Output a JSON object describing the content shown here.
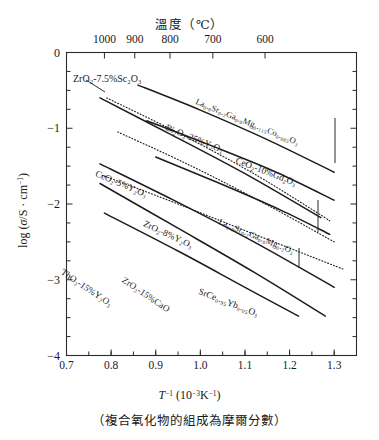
{
  "figure": {
    "top_axis_title": "溫度（℃）",
    "caption": "（複合氧化物的組成為摩爾分數）",
    "x_axis_label_html": "T⁻¹ (10⁻³K⁻¹)",
    "y_axis_label_html": "log (σ/S · cm⁻¹)"
  },
  "chart_data": {
    "type": "line",
    "title": "",
    "xlabel": "T^-1 (10^-3 K^-1)",
    "ylabel": "log (sigma / S cm^-1)",
    "xlim": [
      0.7,
      1.35
    ],
    "ylim": [
      -4,
      0
    ],
    "grid": false,
    "legend": "inline-curve-labels",
    "x_ticks": [
      "0.7",
      "0.8",
      "0.9",
      "1.0",
      "1.1",
      "1.2",
      "1.3"
    ],
    "x_tick_values": [
      0.7,
      0.8,
      0.9,
      1.0,
      1.1,
      1.2,
      1.3
    ],
    "y_ticks": [
      "0",
      "-1",
      "-2",
      "-3",
      "-4"
    ],
    "y_tick_values": [
      0,
      -1,
      -2,
      -3,
      -4
    ],
    "secondary_x_axis": {
      "label": "溫度（℃）",
      "ticks": [
        "1000",
        "900",
        "800",
        "700",
        "600"
      ],
      "tick_values_celsius": [
        1000,
        900,
        800,
        700,
        600
      ],
      "tick_x_inverse_T": [
        0.785,
        0.853,
        0.932,
        1.028,
        1.145
      ]
    },
    "series": [
      {
        "name": "ZrO2-7.5%Sc2O3",
        "label": "ZrO₂-7.5%Sc₂O₃",
        "style": "solid",
        "points": [
          [
            0.775,
            -0.6
          ],
          [
            0.93,
            -1.07
          ],
          [
            1.1,
            -1.6
          ],
          [
            1.27,
            -2.18
          ]
        ]
      },
      {
        "name": "Bi2O3-25%Y2O3",
        "label": "Bi₂O₃-25%Y₂O₃",
        "style": "dotted",
        "points": [
          [
            0.79,
            -0.6
          ],
          [
            0.95,
            -1.06
          ],
          [
            1.12,
            -1.6
          ],
          [
            1.29,
            -2.22
          ]
        ]
      },
      {
        "name": "La0.8Sr0.2Ga0.8Mg0.115Co0.085O3",
        "label": "La₀.₈Sr₀.₂Ga₀.₈Mg₀.₁₁₅Co₀.₀₈₅O₃",
        "style": "solid",
        "points": [
          [
            0.86,
            -0.43
          ],
          [
            1.0,
            -0.76
          ],
          [
            1.15,
            -1.15
          ],
          [
            1.3,
            -1.58
          ]
        ]
      },
      {
        "name": "CeO2-5%Y2O3",
        "label": "CeO₂-5%Y₂O₃",
        "style": "dotted",
        "points": [
          [
            0.815,
            -1.05
          ],
          [
            0.97,
            -1.47
          ],
          [
            1.13,
            -1.95
          ],
          [
            1.3,
            -2.5
          ]
        ]
      },
      {
        "name": "CeO2-10%Gd2O3",
        "label": "CeO₂-10%Gd₂O₃",
        "style": "solid",
        "points": [
          [
            0.88,
            -0.9
          ],
          [
            1.02,
            -1.22
          ],
          [
            1.17,
            -1.58
          ],
          [
            1.3,
            -1.95
          ]
        ]
      },
      {
        "name": "ZrO2-8%Y2O3",
        "label": "ZrO₂-8%Y₂O₃",
        "style": "solid",
        "points": [
          [
            0.775,
            -1.47
          ],
          [
            0.94,
            -1.95
          ],
          [
            1.12,
            -2.5
          ],
          [
            1.3,
            -3.1
          ]
        ]
      },
      {
        "name": "La0.8Sr0.2Ga0.8Mg0.2O3",
        "label": "La₀.₈Sr₀.₂Ga₀.₈Mg₀.₂O₃",
        "style": "solid",
        "points": [
          [
            0.9,
            -1.38
          ],
          [
            1.04,
            -1.72
          ],
          [
            1.18,
            -2.08
          ],
          [
            1.29,
            -2.4
          ]
        ]
      },
      {
        "name": "SrCe0.95Yb0.05O3",
        "label": "SrCe₀.₉₅Yb₀.₀₅O₃",
        "style": "dotted",
        "points": [
          [
            0.78,
            -1.62
          ],
          [
            0.95,
            -2.0
          ],
          [
            1.13,
            -2.42
          ],
          [
            1.32,
            -2.86
          ]
        ]
      },
      {
        "name": "ZrO2-15%CaO",
        "label": "ZrO₂-15%CaO",
        "style": "solid",
        "points": [
          [
            0.775,
            -1.73
          ],
          [
            0.95,
            -2.32
          ],
          [
            1.12,
            -2.9
          ],
          [
            1.28,
            -3.48
          ]
        ]
      },
      {
        "name": "ThO2-15%Y2O3",
        "label": "ThO₂-15%Y₂O₃",
        "style": "solid",
        "points": [
          [
            0.785,
            -2.12
          ],
          [
            0.95,
            -2.62
          ],
          [
            1.1,
            -3.1
          ],
          [
            1.22,
            -3.48
          ]
        ]
      }
    ]
  }
}
